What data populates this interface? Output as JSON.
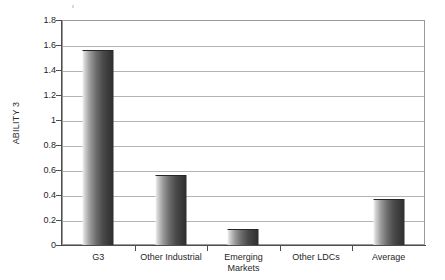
{
  "chart_data": {
    "type": "bar",
    "title": "",
    "xlabel": "",
    "ylabel": "ABILITY 3",
    "ylim": [
      0,
      1.8
    ],
    "yticks": [
      "0",
      "0.2",
      "0.4",
      "0.6",
      "0.8",
      "1",
      "1.2",
      "1.4",
      "1.6",
      "1.8"
    ],
    "ytick_values": [
      0,
      0.2,
      0.4,
      0.6,
      0.8,
      1.0,
      1.2,
      1.4,
      1.6,
      1.8
    ],
    "grid": true,
    "legend": "none",
    "categories": [
      "G3",
      "Other Industrial",
      "Emerging Markets",
      "Other LDCs",
      "Average"
    ],
    "category_lines": [
      [
        "G3"
      ],
      [
        "Other Industrial"
      ],
      [
        "Emerging",
        "Markets"
      ],
      [
        "Other LDCs"
      ],
      [
        "Average"
      ]
    ],
    "values": [
      1.56,
      0.56,
      0.13,
      0.0,
      0.37
    ],
    "series": [
      {
        "name": "ABILITY 3",
        "values": [
          1.56,
          0.56,
          0.13,
          0.0,
          0.37
        ]
      }
    ]
  },
  "style": {
    "bar_light": "#f2f2f2",
    "bar_dark": "#2e2e2e",
    "gridline_color": "#b4b4b4",
    "axis_color": "#4d4d4d",
    "frame_color": "#9a9a9a",
    "text_color": "#1f1f1f",
    "background": "#ffffff"
  }
}
